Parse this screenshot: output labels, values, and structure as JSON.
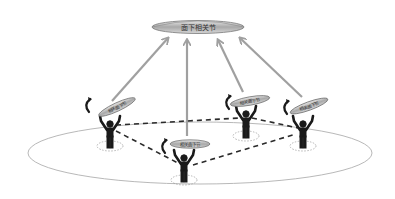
{
  "diagram": {
    "top_node": {
      "label": "面下相关节",
      "fill": "#b8b8b8"
    },
    "agents": [
      {
        "id": "agent-1",
        "label": "相关面下节",
        "has_rotation_arrow": true
      },
      {
        "id": "agent-2",
        "label": "相关面下节",
        "has_rotation_arrow": true
      },
      {
        "id": "agent-3",
        "label": "相关面下节",
        "has_rotation_arrow": true
      },
      {
        "id": "agent-4",
        "label": "相关面下节",
        "has_rotation_arrow": true
      }
    ],
    "connections": {
      "upward_arrows": [
        "agent-1",
        "agent-2",
        "agent-3",
        "agent-4"
      ],
      "dashed_links": [
        [
          "agent-1",
          "agent-3"
        ],
        [
          "agent-1",
          "agent-2"
        ],
        [
          "agent-2",
          "agent-4"
        ],
        [
          "agent-3",
          "agent-4"
        ]
      ]
    },
    "colors": {
      "arrow": "#a0a0a0",
      "figure": "#1a1a1a",
      "dashed": "#2a2a2a",
      "ground": "#b0b0b0",
      "disc": "#b8b8b8"
    }
  }
}
